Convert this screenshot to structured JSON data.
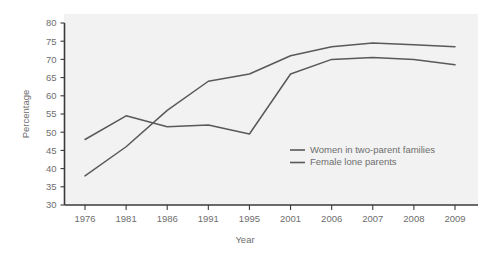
{
  "chart_data": {
    "type": "line",
    "title": "",
    "xlabel": "Year",
    "ylabel": "Percentage",
    "categories": [
      "1976",
      "1981",
      "1986",
      "1991",
      "1995",
      "2001",
      "2006",
      "2007",
      "2008",
      "2009"
    ],
    "ylim": [
      30,
      80
    ],
    "yticks": [
      30,
      35,
      40,
      45,
      50,
      55,
      60,
      65,
      70,
      75,
      80
    ],
    "ytick_labels": [
      "30",
      "35",
      "40",
      "45",
      "50",
      "55",
      "60",
      "65",
      "70",
      "75",
      "80"
    ],
    "grid": false,
    "legend_position": "center-right-inside",
    "series": [
      {
        "name": "Women in two-parent families",
        "color": "#595959",
        "values": [
          38,
          46,
          56,
          64,
          66,
          71,
          73.5,
          74.5,
          74,
          73.5
        ]
      },
      {
        "name": "Female lone parents",
        "color": "#595959",
        "values": [
          48,
          54.5,
          51.5,
          52,
          49.5,
          66,
          70,
          70.5,
          70,
          68.5
        ]
      }
    ]
  },
  "axes": {
    "y_title": "Percentage",
    "x_title": "Year"
  },
  "legend": {
    "items": [
      {
        "label": "Women in two-parent families"
      },
      {
        "label": "Female lone parents"
      }
    ]
  }
}
